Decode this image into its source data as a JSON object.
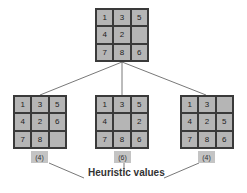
{
  "diagram": {
    "type": "search-tree",
    "root": {
      "cells": [
        "1",
        "3",
        "5",
        "4",
        "2",
        "",
        "7",
        "8",
        "6"
      ]
    },
    "children": [
      {
        "cells": [
          "1",
          "3",
          "5",
          "4",
          "2",
          "6",
          "7",
          "8",
          ""
        ],
        "heuristic": "(4)"
      },
      {
        "cells": [
          "1",
          "3",
          "5",
          "4",
          "",
          "2",
          "7",
          "8",
          "6"
        ],
        "heuristic": "(6)"
      },
      {
        "cells": [
          "1",
          "3",
          "",
          "4",
          "2",
          "5",
          "7",
          "8",
          "6"
        ],
        "heuristic": "(4)"
      }
    ],
    "caption": "Heuristic values",
    "colors": {
      "tile": "#b5b5b5",
      "border": "#3a3a3a",
      "badge": "#c4c4c4",
      "line": "#555555"
    }
  }
}
